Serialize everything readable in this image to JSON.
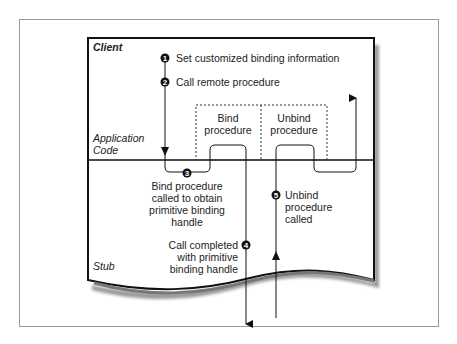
{
  "regions": {
    "client": "Client",
    "application_code": [
      "Application",
      "Code"
    ],
    "stub": "Stub"
  },
  "steps": [
    {
      "number": "1",
      "text": [
        "Set customized binding information"
      ]
    },
    {
      "number": "2",
      "text": [
        "Call remote procedure"
      ]
    },
    {
      "number": "3",
      "text": [
        "Bind procedure",
        "called to obtain",
        "primitive binding",
        "handle"
      ]
    },
    {
      "number": "4",
      "text": [
        "Call completed",
        "with primitive",
        "binding handle"
      ]
    },
    {
      "number": "5",
      "text": [
        "Unbind",
        "procedure",
        "called"
      ]
    }
  ],
  "boxes": {
    "bind": [
      "Bind",
      "procedure"
    ],
    "unbind": [
      "Unbind",
      "procedure"
    ]
  }
}
